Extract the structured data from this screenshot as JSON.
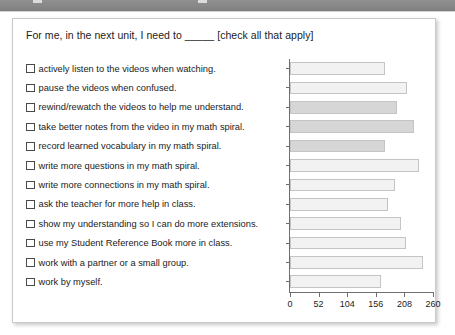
{
  "topbar": {
    "name": "window-chrome-bar",
    "color": "#8a8a8a"
  },
  "card": {
    "title": "For me, in the next unit, I need to _____ [check all that apply]"
  },
  "chart_data": {
    "type": "bar",
    "orientation": "horizontal",
    "title": "For me, in the next unit, I need to _____ [check all that apply]",
    "xlabel": "",
    "ylabel": "",
    "xlim": [
      0,
      260
    ],
    "xticks": [
      0,
      52,
      104,
      156,
      208,
      260
    ],
    "xtick_labels": [
      "0",
      "52",
      "104",
      "156",
      "208",
      "260"
    ],
    "grid": false,
    "legend": false,
    "categories": [
      "actively listen to the videos when watching.",
      "pause the videos when confused.",
      "rewind/rewatch the videos to help me understand.",
      "take better notes from the video in my math spiral.",
      "record learned vocabulary in my math spiral.",
      "write more questions in my math spiral.",
      "write more connections in my math spiral.",
      "ask the teacher for more help in class.",
      "show my understanding so I can do more extensions.",
      "use my Student Reference Book more in class.",
      "work with a partner or a small group.",
      "work by myself."
    ],
    "values": [
      173,
      213,
      195,
      226,
      173,
      235,
      190,
      179,
      202,
      211,
      242,
      166
    ],
    "bar_shades": [
      "light",
      "light",
      "dark",
      "dark",
      "dark",
      "light",
      "light",
      "light",
      "light",
      "light",
      "light",
      "light"
    ],
    "colors": {
      "bar_light": "#f2f2f2",
      "bar_dark": "#d6d6d6",
      "bar_border": "#c4c4c4",
      "axis": "#6f6f6f"
    }
  },
  "checklist": [
    {
      "checked": false,
      "label": "actively listen to the videos when watching."
    },
    {
      "checked": false,
      "label": "pause the videos when confused."
    },
    {
      "checked": false,
      "label": "rewind/rewatch the videos to help me understand."
    },
    {
      "checked": false,
      "label": "take better notes from the video in my math spiral."
    },
    {
      "checked": false,
      "label": "record learned vocabulary in my math spiral."
    },
    {
      "checked": false,
      "label": "write more questions in my math spiral."
    },
    {
      "checked": false,
      "label": "write more connections in my math spiral."
    },
    {
      "checked": false,
      "label": "ask the teacher for more help in class."
    },
    {
      "checked": false,
      "label": "show my understanding so I can do more extensions."
    },
    {
      "checked": false,
      "label": "use my Student Reference Book more in class."
    },
    {
      "checked": false,
      "label": "work with a partner or a small group."
    },
    {
      "checked": false,
      "label": "work by myself."
    }
  ]
}
